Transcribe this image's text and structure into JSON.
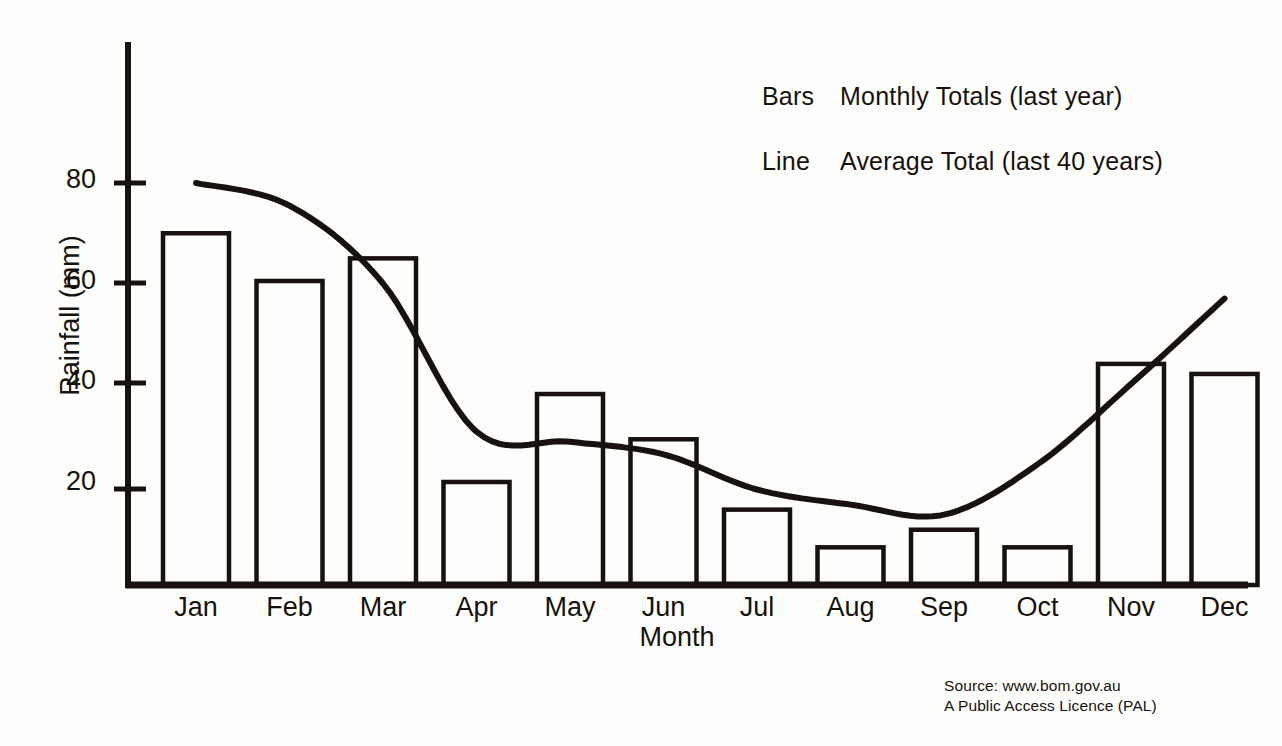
{
  "chart_data": {
    "type": "bar",
    "title": "",
    "xlabel": "Month",
    "ylabel": "Rainfall (mm)",
    "categories": [
      "Jan",
      "Feb",
      "Mar",
      "Apr",
      "May",
      "Jun",
      "Jul",
      "Aug",
      "Sep",
      "Oct",
      "Nov",
      "Dec"
    ],
    "ylim": [
      0,
      90
    ],
    "ytick_labels": [
      "20",
      "40",
      "60",
      "80"
    ],
    "yticks": [
      20,
      40,
      60,
      80
    ],
    "grid": false,
    "legend_position": "upper-right",
    "series": [
      {
        "name": "Bars",
        "label": "Monthly Totals (last year)",
        "type": "bar",
        "values": [
          70,
          60.5,
          65,
          20.5,
          38,
          29,
          15,
          7.5,
          11,
          7.5,
          44,
          42
        ]
      },
      {
        "name": "Line",
        "label": "Average Total (last 40 years)",
        "type": "line",
        "values": [
          80,
          75.5,
          60,
          30.5,
          28.5,
          26,
          19,
          16,
          14,
          24,
          40,
          57
        ]
      }
    ]
  },
  "legend": {
    "rows": [
      {
        "key": "Bars",
        "desc": "Monthly Totals (last year)"
      },
      {
        "key": "Line",
        "desc": "Average Total (last 40 years)"
      }
    ]
  },
  "axes": {
    "x_title": "Month",
    "y_title": "Rainfall (mm)"
  },
  "source": {
    "line1": "Source: www.bom.gov.au",
    "line2": "A Public Access Licence (PAL)"
  },
  "colors": {
    "ink": "#17120d",
    "background": "#fdfdfb"
  }
}
